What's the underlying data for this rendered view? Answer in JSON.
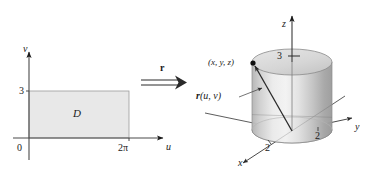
{
  "figure": {
    "background_color": "#ffffff",
    "ink_color": "#1a1a1a",
    "region_fill_color": "#e8e8e8",
    "region_stroke_color": "#9a9a9a"
  },
  "left_panel": {
    "name": "uv-plane domain",
    "axes": {
      "horizontal_label": "u",
      "vertical_label": "v",
      "origin_label": "0"
    },
    "ticks": {
      "vertical": "3",
      "horizontal": "2π"
    },
    "region": {
      "label": "D",
      "fill_color": "#e8e8e8",
      "u_range": [
        0,
        6.283185
      ],
      "v_range": [
        0,
        3
      ]
    }
  },
  "map_arrow": {
    "name": "mapping arrow",
    "label": "r",
    "glyph": "double-arrow-right-icon",
    "direction": "right"
  },
  "right_panel": {
    "name": "xyz-space cylinder",
    "axes": {
      "x_label": "x",
      "y_label": "y",
      "z_label": "z"
    },
    "ticks": {
      "z": "3",
      "y": "2",
      "x": "2"
    },
    "point": {
      "label": "(x, y, z)",
      "marker": "filled-dot-icon"
    },
    "vector": {
      "label": "r(u, v)",
      "label_bold_part": "r",
      "label_args": "(u, v)"
    },
    "surface": {
      "shape": "cylinder",
      "radius": 2,
      "height": 3,
      "fill_light": "#ececec",
      "fill_mid": "#d2d2d2",
      "fill_dark": "#a9a9a9",
      "top_fill": "#d9d9d9"
    }
  }
}
